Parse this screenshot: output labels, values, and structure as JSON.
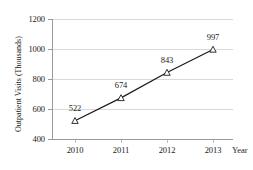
{
  "chart_data": {
    "type": "line",
    "title": "",
    "subtitle": "",
    "xlabel": "Year",
    "ylabel": "Outpatient Visits (Thousands)",
    "categories": [
      "2010",
      "2011",
      "2012",
      "2013"
    ],
    "x": [
      2010,
      2011,
      2012,
      2013
    ],
    "values": [
      522,
      674,
      843,
      997
    ],
    "point_labels": [
      "522",
      "674",
      "843",
      "997"
    ],
    "series": [
      {
        "name": "Outpatient Visits",
        "values": [
          522,
          674,
          843,
          997
        ]
      }
    ],
    "ylim": [
      400,
      1200
    ],
    "yticks": [
      400,
      600,
      800,
      1000,
      1200
    ],
    "ytick_labels": [
      "400",
      "600",
      "800",
      "1000",
      "1200"
    ],
    "xticks": [
      2010,
      2011,
      2012,
      2013
    ],
    "xtick_labels": [
      "2010",
      "2011",
      "2012",
      "2013"
    ],
    "grid": "horizontal",
    "legend": "none",
    "marker": "triangle-open",
    "line_color": "#1a1a1a",
    "grid_color": "#d9d9d9",
    "axis_color": "#9a9a9a",
    "background": "#ffffff"
  }
}
